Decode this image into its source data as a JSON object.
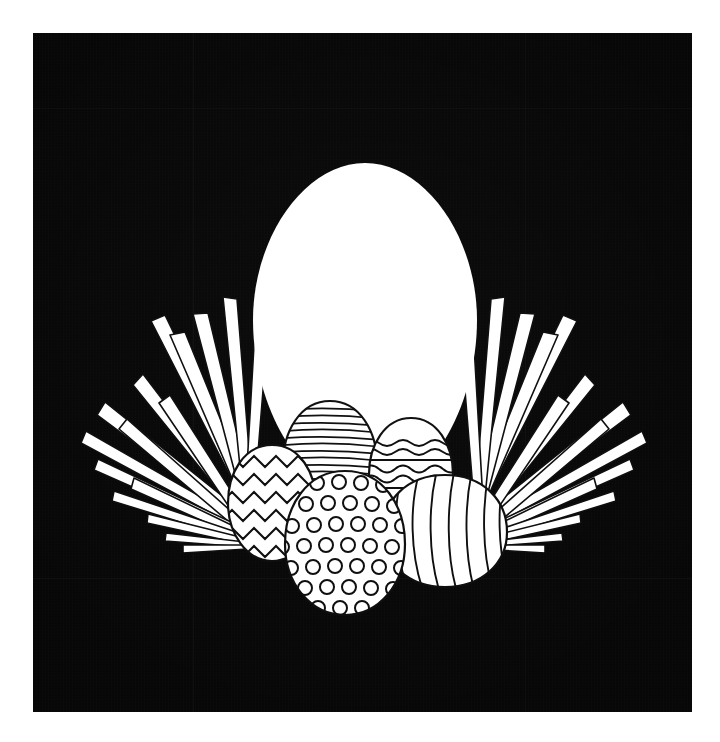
{
  "canvas": {
    "width": 720,
    "height": 742,
    "background_color": "#ffffff",
    "title": "Easter egg and grass illustration on black napkin"
  },
  "napkin": {
    "name": "black-napkin",
    "color": "#070707",
    "x": 33,
    "y": 33,
    "width": 659,
    "height": 679,
    "folds": [
      {
        "orientation": "vertical",
        "position": 160
      },
      {
        "orientation": "horizontal",
        "position": 545
      },
      {
        "orientation": "vertical",
        "position": 492
      },
      {
        "orientation": "horizontal",
        "position": 75
      }
    ]
  },
  "artwork": {
    "name": "easter-egg-illustration",
    "style": "white silhouette line art",
    "ink_color": "#0d0d0d",
    "paper_color": "#ffffff",
    "elements": [
      "large-white-egg",
      "grass-tuft-left",
      "grass-tuft-right",
      "zigzag-egg",
      "striped-egg",
      "wavy-egg",
      "polka-dot-egg",
      "swirl-egg"
    ]
  },
  "main_egg": {
    "name": "large-white-egg",
    "fill": "#ffffff",
    "outline": "none",
    "center_x": 332,
    "top_y": 130,
    "width": 224,
    "height": 330
  },
  "eggs": [
    {
      "id": "zigzag-egg",
      "label": "Zigzag egg",
      "pattern": "zigzag",
      "position": "left",
      "cx": 239,
      "cy": 470,
      "rx": 44,
      "ry": 58,
      "rotation": -14,
      "bands": 5
    },
    {
      "id": "striped-egg",
      "label": "Striped egg",
      "pattern": "horizontal-stripes",
      "position": "back-left",
      "cx": 297,
      "cy": 430,
      "rx": 47,
      "ry": 62,
      "rotation": -6,
      "bands": 17
    },
    {
      "id": "wavy-egg",
      "label": "Wavy band egg",
      "pattern": "wavy-bands",
      "position": "back-right",
      "cx": 378,
      "cy": 440,
      "rx": 42,
      "ry": 55,
      "rotation": 4,
      "bands": 4
    },
    {
      "id": "polka-dot-egg",
      "label": "Polka dot egg",
      "pattern": "polka-dots",
      "position": "front-center",
      "cx": 312,
      "cy": 510,
      "rx": 60,
      "ry": 72,
      "rotation": 0,
      "bands": 0
    },
    {
      "id": "swirl-egg",
      "label": "Swirl egg",
      "pattern": "curved-swirls",
      "position": "right",
      "cx": 412,
      "cy": 498,
      "rx": 62,
      "ry": 56,
      "rotation": 8,
      "bands": 9
    }
  ],
  "grass": {
    "left": {
      "id": "grass-tuft-left",
      "blade_count": 16,
      "base_x": 214,
      "base_y": 470,
      "spread_degrees": 105
    },
    "right": {
      "id": "grass-tuft-right",
      "blade_count": 16,
      "base_x": 448,
      "base_y": 470,
      "spread_degrees": 105
    }
  }
}
